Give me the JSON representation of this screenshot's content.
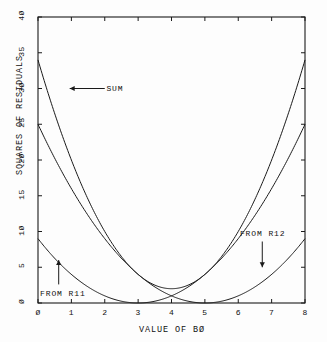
{
  "chart_data": {
    "type": "line",
    "title": "",
    "xlabel": "VALUE OF BØ",
    "ylabel": "SQUARES OF RESIDUALS",
    "xlim": [
      0,
      8
    ],
    "ylim": [
      0,
      40
    ],
    "grid": false,
    "frame": "box",
    "legend_position": "inline-annotations",
    "x_ticks": [
      0,
      1,
      2,
      3,
      4,
      5,
      6,
      7,
      8
    ],
    "x_tick_labels": [
      "Ø",
      "1",
      "2",
      "3",
      "4",
      "5",
      "6",
      "7",
      "8"
    ],
    "y_ticks": [
      0,
      5,
      10,
      15,
      20,
      25,
      30,
      35,
      40
    ],
    "y_tick_labels": [
      "Ø",
      "5",
      "1Ø",
      "15",
      "2Ø",
      "25",
      "3Ø",
      "35",
      "4Ø"
    ],
    "x": [
      0,
      0.5,
      1,
      1.5,
      2,
      2.5,
      3,
      3.5,
      4,
      4.5,
      5,
      5.5,
      6,
      6.5,
      7,
      7.5,
      8
    ],
    "series": [
      {
        "name": "FROM R11",
        "formula": "y = (x - 3)^2",
        "values": [
          9,
          6.25,
          4,
          2.25,
          1,
          0.25,
          0,
          0.25,
          1,
          2.25,
          4,
          6.25,
          9,
          12.25,
          16,
          20.25,
          25
        ]
      },
      {
        "name": "FROM R12",
        "formula": "y = (x - 5)^2",
        "values": [
          25,
          20.25,
          16,
          12.25,
          9,
          6.25,
          4,
          2.25,
          1,
          0.25,
          0,
          0.25,
          1,
          2.25,
          4,
          6.25,
          9
        ]
      },
      {
        "name": "SUM",
        "formula": "y = (x - 3)^2 + (x - 5)^2",
        "values": [
          34,
          26.5,
          20,
          14.5,
          10,
          6.5,
          4,
          2.5,
          2,
          2.5,
          4,
          6.5,
          10,
          14.5,
          20,
          26.5,
          34
        ]
      }
    ],
    "annotations": [
      {
        "text": "SUM",
        "arrow": "left",
        "points_to_x": 0.9,
        "points_to_y": 30
      },
      {
        "text": "FROM R11",
        "arrow": "up",
        "points_to_x": 0.65,
        "points_to_y": 5.5
      },
      {
        "text": "FROM R12",
        "arrow": "down",
        "points_to_x": 6.75,
        "points_to_y": 5.2
      }
    ]
  },
  "axes": {
    "y_title": "SQUARES OF RESIDUALS",
    "x_title": "VALUE OF BØ"
  },
  "annotations": {
    "sum_label": "SUM",
    "r11_label": "FROM R11",
    "r12_label": "FROM R12"
  },
  "colors": {
    "line": "#1a1a1a",
    "axis": "#1a1a1a",
    "background": "#fdfdfd"
  }
}
